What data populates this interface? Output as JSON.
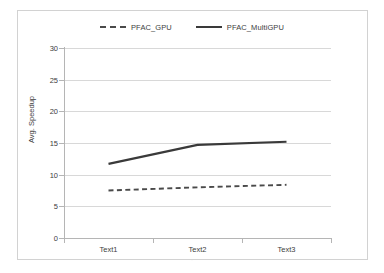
{
  "chart_data": {
    "type": "line",
    "title": "",
    "xlabel": "",
    "ylabel": "Avg. Speedup",
    "categories": [
      "Text1",
      "Text2",
      "Text3"
    ],
    "series": [
      {
        "name": "PFAC_GPU",
        "style": "dashed",
        "color": "#4a4a4a",
        "values": [
          7.5,
          8.0,
          8.4
        ]
      },
      {
        "name": "PFAC_MultiGPU",
        "style": "solid",
        "color": "#3a3a3a",
        "values": [
          11.7,
          14.7,
          15.2
        ]
      }
    ],
    "ylim": [
      0,
      30
    ],
    "ytick_step": 5,
    "yticks": [
      0,
      5,
      10,
      15,
      20,
      25,
      30
    ],
    "grid": "horizontal",
    "legend_position": "top-center"
  },
  "axes": {
    "y_label": "Avg. Speedup",
    "y_ticks": [
      "0",
      "5",
      "10",
      "15",
      "20",
      "25",
      "30"
    ],
    "x_ticks": [
      "Text1",
      "Text2",
      "Text3"
    ]
  },
  "legend": {
    "entries": [
      {
        "label": "PFAC_GPU"
      },
      {
        "label": "PFAC_MultiGPU"
      }
    ]
  },
  "colors": {
    "series_gpu": "#4a4a4a",
    "series_multigpu": "#3a3a3a",
    "gridline": "#d8d8d8",
    "axis": "#b5b5b5",
    "frame": "#d2d2d2",
    "text": "#3d3d3d",
    "background": "#ffffff"
  }
}
